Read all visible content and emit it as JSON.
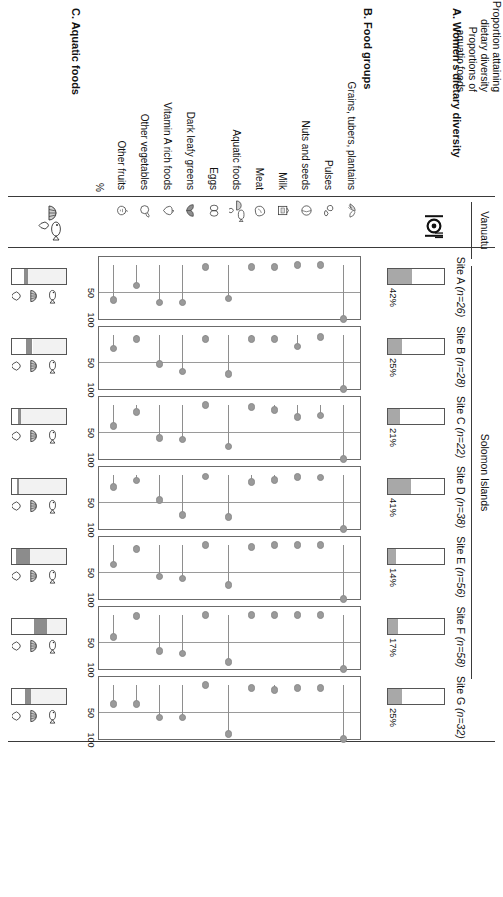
{
  "figure": {
    "regions": [
      {
        "name": "Vanuatu",
        "sites": [
          "A"
        ]
      },
      {
        "name": "Solomon Islands",
        "sites": [
          "B",
          "C",
          "D",
          "E",
          "F",
          "G"
        ]
      }
    ],
    "sections": {
      "a_title": "A. Women's dietary diversity",
      "b_title": "B. Food groups",
      "c_title": "C. Aquatic foods"
    },
    "row_labels": {
      "proportion_attaining": "Proportion attaining",
      "dietary_diversity": "dietary diversity",
      "proportions_of": "Proportions of",
      "aquatic_foods": "aquatic foods"
    },
    "axis": {
      "ticks": [
        "50",
        "100"
      ],
      "tick_values": [
        50,
        100
      ],
      "unit": "%",
      "xmin": 0,
      "xmax": 100
    },
    "colors": {
      "fill_gray": "#a8a8a8",
      "dot_gray": "#9a9a9a",
      "aq_light": "#f2f2f2",
      "aq_mid": "#8c8c8c",
      "aq_white": "#ffffff",
      "border": "#555555",
      "grid": "#d9d9d9"
    }
  },
  "sites": [
    {
      "id": "A",
      "label": "Site A",
      "n": "(n=26)",
      "n_value": 26,
      "region": "Vanuatu",
      "diversity_pct": 42,
      "diversity_label": "42%"
    },
    {
      "id": "B",
      "label": "Site B",
      "n": "(n=28)",
      "n_value": 28,
      "region": "Solomon Islands",
      "diversity_pct": 25,
      "diversity_label": "25%"
    },
    {
      "id": "C",
      "label": "Site C",
      "n": "(n=22)",
      "n_value": 22,
      "region": "Solomon Islands",
      "diversity_pct": 21,
      "diversity_label": "21%"
    },
    {
      "id": "D",
      "label": "Site D",
      "n": "(n=38)",
      "n_value": 38,
      "region": "Solomon Islands",
      "diversity_pct": 41,
      "diversity_label": "41%"
    },
    {
      "id": "E",
      "label": "Site E",
      "n": "(n=56)",
      "n_value": 56,
      "region": "Solomon Islands",
      "diversity_pct": 14,
      "diversity_label": "14%"
    },
    {
      "id": "F",
      "label": "Site F",
      "n": "(n=58)",
      "n_value": 58,
      "region": "Solomon Islands",
      "diversity_pct": 17,
      "diversity_label": "17%"
    },
    {
      "id": "G",
      "label": "Site G",
      "n": "(n=32)",
      "n_value": 32,
      "region": "Solomon Islands",
      "diversity_pct": 25,
      "diversity_label": "25%"
    }
  ],
  "food_groups": [
    {
      "label": "Grains, tubers, plantains",
      "icon": "grains-tubers-plantains-icon"
    },
    {
      "label": "Pulses",
      "icon": "pulses-icon"
    },
    {
      "label": "Nuts and seeds",
      "icon": "nuts-and-seeds-icon"
    },
    {
      "label": "Milk",
      "icon": "milk-icon"
    },
    {
      "label": "Meat",
      "icon": "meat-icon"
    },
    {
      "label": "Aquatic foods",
      "icon": "aquatic-foods-icon"
    },
    {
      "label": "Eggs",
      "icon": "eggs-icon"
    },
    {
      "label": "Dark leafy greens",
      "icon": "dark-leafy-greens-icon"
    },
    {
      "label": "Vitamin A rich foods",
      "icon": "vitamin-a-rich-foods-icon"
    },
    {
      "label": "Other vegetables",
      "icon": "other-vegetables-icon"
    },
    {
      "label": "Other fruits",
      "icon": "other-fruits-icon"
    }
  ],
  "aquatic_legend": [
    {
      "name": "finfish-icon",
      "label": "finfish"
    },
    {
      "name": "shellfish-icon",
      "label": "shellfish"
    },
    {
      "name": "other-aquatic-icon",
      "label": "other aquatic"
    }
  ],
  "chart_data": {
    "type": "line",
    "xlabel": "%",
    "ylabel": "",
    "xlim": [
      0,
      100
    ],
    "grid": true,
    "legend": "none",
    "categories": [
      "Grains, tubers, plantains",
      "Pulses",
      "Nuts and seeds",
      "Milk",
      "Meat",
      "Aquatic foods",
      "Eggs",
      "Dark leafy greens",
      "Vitamin A rich foods",
      "Other vegetables",
      "Other fruits"
    ],
    "series": [
      {
        "name": "Site A (n=26)",
        "values": [
          100,
          0,
          0,
          4,
          4,
          62,
          4,
          69,
          69,
          38,
          65
        ]
      },
      {
        "name": "Site B (n=28)",
        "values": [
          100,
          4,
          21,
          7,
          7,
          72,
          7,
          68,
          54,
          7,
          25
        ]
      },
      {
        "name": "Site C (n=22)",
        "values": [
          100,
          19,
          22,
          9,
          4,
          77,
          0,
          64,
          61,
          13,
          39
        ]
      },
      {
        "name": "Site D (n=38)",
        "values": [
          100,
          5,
          4,
          9,
          13,
          78,
          3,
          74,
          46,
          10,
          22
        ]
      },
      {
        "name": "Site E (n=56)",
        "values": [
          100,
          0,
          0,
          0,
          4,
          74,
          0,
          62,
          58,
          7,
          36
        ]
      },
      {
        "name": "Site F (n=58)",
        "values": [
          100,
          0,
          0,
          0,
          0,
          87,
          0,
          71,
          67,
          2,
          41
        ]
      },
      {
        "name": "Site G (n=32)",
        "values": [
          100,
          6,
          6,
          9,
          6,
          91,
          0,
          60,
          60,
          35,
          35
        ]
      }
    ],
    "proportion_attaining_dietary_diversity": {
      "type": "bar",
      "title": "Proportion attaining dietary diversity (%)",
      "categories": [
        "Site A",
        "Site B",
        "Site C",
        "Site D",
        "Site E",
        "Site F",
        "Site G"
      ],
      "values": [
        42,
        25,
        21,
        41,
        14,
        17,
        25
      ],
      "ylim": [
        0,
        100
      ]
    },
    "aquatic_food_proportions": {
      "type": "bar",
      "title": "Proportions of aquatic foods (%)",
      "stacked": true,
      "categories": [
        "Site A",
        "Site B",
        "Site C",
        "Site D",
        "Site E",
        "Site F",
        "Site G"
      ],
      "segments": [
        {
          "name": "other aquatic",
          "values": [
            22,
            26,
            12,
            10,
            8,
            40,
            25
          ]
        },
        {
          "name": "shellfish",
          "values": [
            8,
            12,
            4,
            3,
            26,
            24,
            11
          ]
        },
        {
          "name": "finfish",
          "values": [
            70,
            62,
            84,
            87,
            66,
            36,
            64
          ]
        }
      ]
    }
  },
  "footnote": ""
}
